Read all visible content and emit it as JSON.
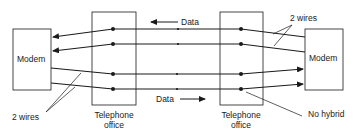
{
  "diagram": {
    "type": "four-wire telephone connection without hybrid",
    "colors": {
      "line": "#1a1a1a",
      "background": "#ffffff"
    },
    "nodes": {
      "left_modem": {
        "label": "Modem"
      },
      "left_office": {
        "label_line1": "Telephone",
        "label_line2": "office"
      },
      "right_office": {
        "label_line1": "Telephone",
        "label_line2": "office"
      },
      "right_modem": {
        "label": "Modem"
      }
    },
    "annotations": {
      "data_top": "Data",
      "data_bottom": "Data",
      "left_wires": "2 wires",
      "right_wires": "2 wires",
      "no_hybrid": "No hybrid"
    },
    "flows": [
      {
        "label": "Data",
        "direction": "right-to-left",
        "pair": "upper"
      },
      {
        "label": "Data",
        "direction": "left-to-right",
        "pair": "lower"
      }
    ]
  }
}
